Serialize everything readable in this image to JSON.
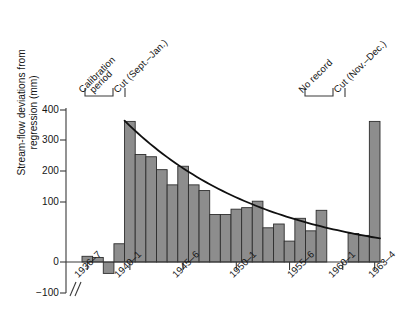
{
  "chart_data": {
    "type": "bar",
    "title": "",
    "subtitle": "",
    "xlabel": "",
    "ylabel": "Stream-flow deviations from regression (mm)",
    "ylabel_lines": [
      "Stream-flow deviations from",
      "regression (mm)"
    ],
    "ylim": [
      -100,
      400
    ],
    "yticks": [
      400,
      300,
      200,
      100,
      0,
      -100
    ],
    "ytick_labels": [
      "400",
      "300",
      "200",
      "100",
      "0",
      "−100"
    ],
    "grid": false,
    "legend": "none",
    "axis_break": true,
    "x_axis_note": "water years; axis broken between start of axis and 1936–7",
    "xtick_labels": [
      "1936–7",
      "1940–1",
      "1945–6",
      "1950–1",
      "1955–6",
      "1960–1",
      "1963–4"
    ],
    "xtick_categories": [
      "1936-7",
      "1940-1",
      "1945-6",
      "1950-1",
      "1955-6",
      "1960-1",
      "1963-4"
    ],
    "categories": [
      "1936-7",
      "1937-8",
      "1938-9",
      "1939-40",
      "1940-1",
      "1941-2",
      "1942-3",
      "1943-4",
      "1944-5",
      "1945-6",
      "1946-7",
      "1947-8",
      "1948-9",
      "1949-50",
      "1950-1",
      "1951-2",
      "1952-3",
      "1953-4",
      "1954-5",
      "1955-6",
      "1956-7",
      "1957-8",
      "1958-9",
      "1959-60",
      "1960-1",
      "1961-2",
      "1962-3",
      "1963-4"
    ],
    "values": [
      15,
      12,
      -30,
      48,
      370,
      283,
      277,
      243,
      203,
      252,
      203,
      188,
      125,
      125,
      139,
      143,
      160,
      90,
      100,
      55,
      115,
      82,
      136,
      null,
      null,
      75,
      70,
      370
    ],
    "missing_label": "No record",
    "missing_categories": [
      "1959-60",
      "1960-1"
    ],
    "fit_curve": {
      "label": "exponential decay fit",
      "x_start": "1940-1",
      "x_end": "1963-4",
      "y_start": 372,
      "y_end": 62
    },
    "annotations": [
      {
        "name": "calibration-period",
        "text": "Calibration period",
        "text_lines": [
          "Calibration",
          "period"
        ],
        "type": "bracket",
        "span": [
          "1936-7",
          "1939-40"
        ]
      },
      {
        "name": "cut-sept-jan",
        "text": "Cut (Sept.–Jan.)",
        "type": "rule",
        "at": "1940-1"
      },
      {
        "name": "no-record",
        "text": "No record",
        "type": "bracket",
        "span": [
          "1959-60",
          "1960-1"
        ]
      },
      {
        "name": "cut-nov-dec",
        "text": "Cut (Nov.–Dec.)",
        "type": "rule",
        "at": "1963-4"
      }
    ],
    "colors": {
      "bar_fill": "#8d8d8d",
      "bar_stroke": "#2e2e2e",
      "curve": "#101010",
      "axis": "#3a3a3a",
      "background": "#ffffff"
    }
  }
}
